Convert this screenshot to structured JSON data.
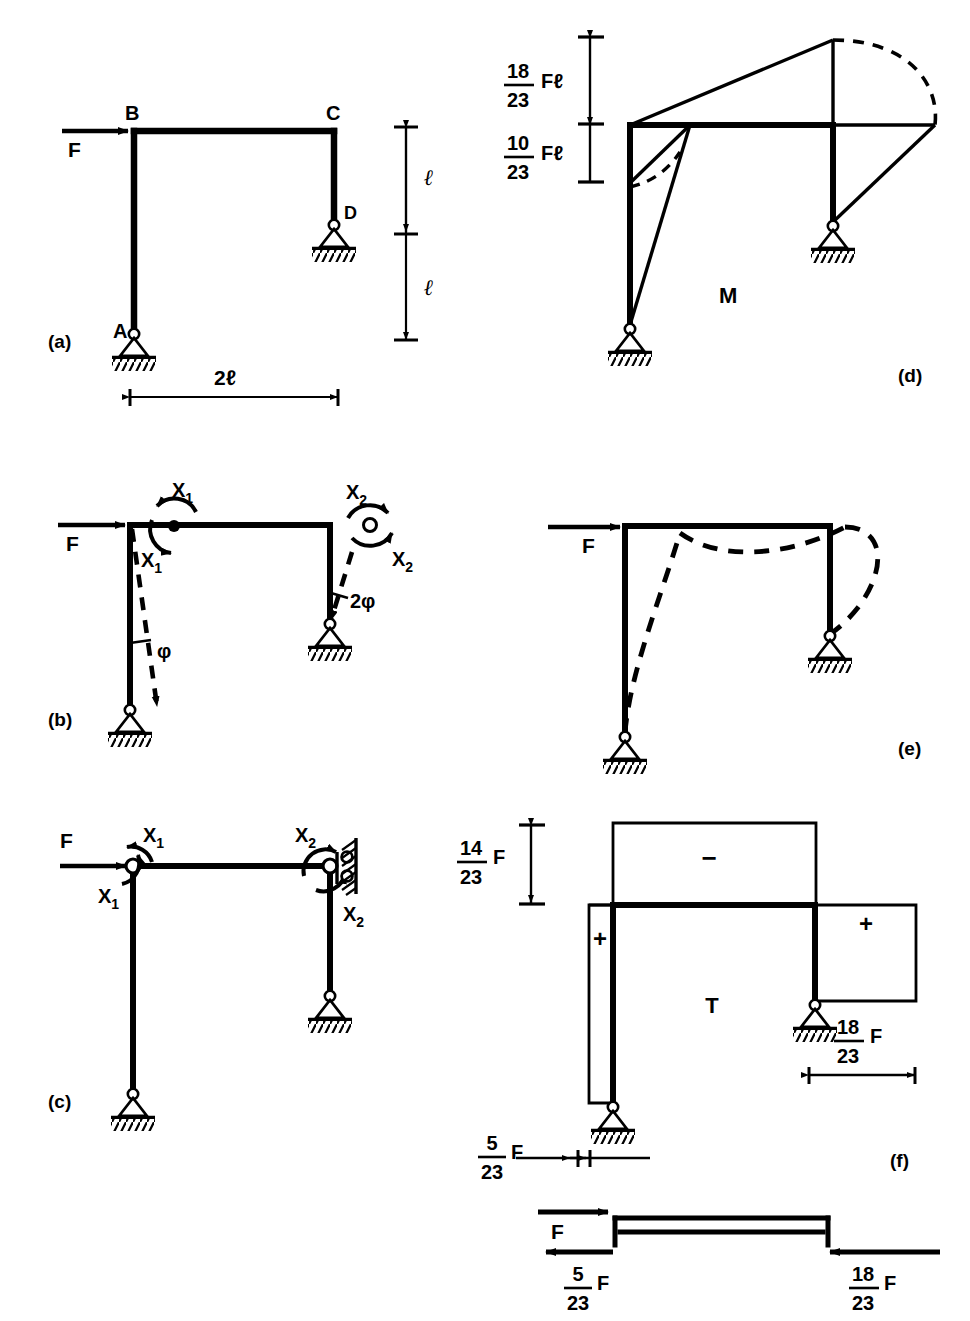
{
  "figure": {
    "panels": [
      {
        "id": "a",
        "label": "(a)",
        "type": "frame-geometry",
        "nodes": [
          "A",
          "B",
          "C",
          "D"
        ],
        "load_label": "F",
        "dimensions": {
          "height_upper": "ℓ",
          "height_lower": "ℓ",
          "span": "2ℓ"
        },
        "supports": [
          "pin-A",
          "pin-D"
        ]
      },
      {
        "id": "b",
        "label": "(b)",
        "type": "virtual-rotation-system",
        "load_label": "F",
        "moment_labels": [
          "X",
          "X",
          "X",
          "X"
        ],
        "moment_subscripts": [
          "1",
          "1",
          "2",
          "2"
        ],
        "angle_labels": [
          "φ",
          "2φ"
        ]
      },
      {
        "id": "c",
        "label": "(c)",
        "type": "released-system-with-roller-wall",
        "load_label": "F",
        "moment_labels": [
          "X",
          "X",
          "X",
          "X"
        ],
        "moment_subscripts": [
          "1",
          "1",
          "2",
          "2"
        ]
      },
      {
        "id": "d",
        "label": "(d)",
        "type": "bending-moment-diagram",
        "diagram_symbol": "M",
        "value_top": {
          "num": "18",
          "den": "23",
          "unit": "Fℓ"
        },
        "value_bottom": {
          "num": "10",
          "den": "23",
          "unit": "Fℓ"
        }
      },
      {
        "id": "e",
        "label": "(e)",
        "type": "deflected-shape",
        "load_label": "F"
      },
      {
        "id": "f",
        "label": "(f)",
        "type": "normal-force-diagram",
        "diagram_symbol": "T",
        "value_top": {
          "num": "14",
          "den": "23",
          "unit": "F"
        },
        "value_right": {
          "num": "18",
          "den": "23",
          "unit": "F"
        },
        "value_left": {
          "num": "5",
          "den": "23",
          "unit": "F"
        },
        "signs": [
          "−",
          "+",
          "+"
        ],
        "equilibrium": {
          "applied_label": "F",
          "reaction_left": {
            "num": "5",
            "den": "23",
            "unit": "F"
          },
          "reaction_right": {
            "num": "18",
            "den": "23",
            "unit": "F"
          }
        }
      }
    ],
    "colors": {
      "ink": "#000000",
      "paper": "#ffffff"
    }
  }
}
